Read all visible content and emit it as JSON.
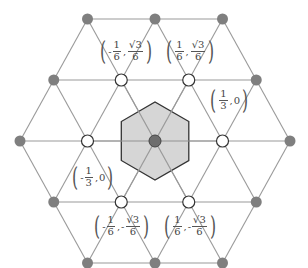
{
  "diagram": {
    "colors": {
      "edge": "#9a9a9a",
      "gray_node": "#7f7f7f",
      "hollow_node": "#ffffff",
      "hexagon_fill": "#cfcfcf",
      "hexagon_stroke": "#333333",
      "center_node": "#6e6e6e"
    },
    "labels": [
      {
        "id": "p1",
        "sign1": "-",
        "n1": "1",
        "d1": "6",
        "sign2": "",
        "n2": "√3",
        "d2": "6"
      },
      {
        "id": "p2",
        "sign1": "",
        "n1": "1",
        "d1": "6",
        "sign2": "",
        "n2": "√3",
        "d2": "6"
      },
      {
        "id": "p3",
        "sign1": "",
        "n1": "1",
        "d1": "3",
        "tail": "0"
      },
      {
        "id": "p4",
        "sign1": "-",
        "n1": "1",
        "d1": "3",
        "tail": "0"
      },
      {
        "id": "p5",
        "sign1": "-",
        "n1": "1",
        "d1": "6",
        "sign2": "-",
        "n2": "√3",
        "d2": "6"
      },
      {
        "id": "p6",
        "sign1": "",
        "n1": "1",
        "d1": "6",
        "sign2": "-",
        "n2": "√3",
        "d2": "6"
      }
    ]
  }
}
